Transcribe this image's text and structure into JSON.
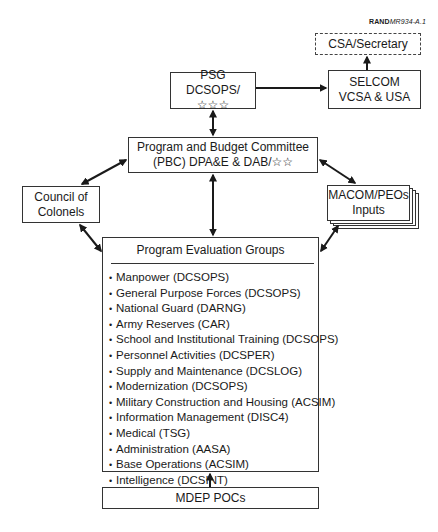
{
  "figure_label": {
    "prefix": "RAND",
    "id": "MR934-A.1"
  },
  "nodes": {
    "csa": {
      "line1": "CSA/Secretary"
    },
    "selcom": {
      "line1": "SELCOM",
      "line2": "VCSA & USA"
    },
    "psg": {
      "line1": "PSG",
      "line2": "DCSOPS/☆☆☆"
    },
    "pbc": {
      "line1": "Program and Budget Committee",
      "line2": "(PBC) DPA&E & DAB/☆☆"
    },
    "council": {
      "line1": "Council of",
      "line2": "Colonels"
    },
    "macom": {
      "line1": "MACOM/PEOs",
      "line2": "Inputs"
    },
    "peg": {
      "title": "Program Evaluation Groups",
      "items": [
        "Manpower (DCSOPS)",
        "General Purpose Forces (DCSOPS)",
        "National Guard (DARNG)",
        "Army Reserves (CAR)",
        "School and Institutional Training (DCSOPS)",
        "Personnel Activities (DCSPER)",
        "Supply and Maintenance (DCSLOG)",
        "Modernization (DCSOPS)",
        "Military Construction and Housing (ACSIM)",
        "Information Management (DISC4)",
        "Medical (TSG)",
        "Administration (AASA)",
        "Base Operations (ACSIM)",
        "Intelligence (DCSINT)"
      ]
    },
    "mdep": {
      "line1": "MDEP POCs"
    }
  },
  "bullet": "•"
}
